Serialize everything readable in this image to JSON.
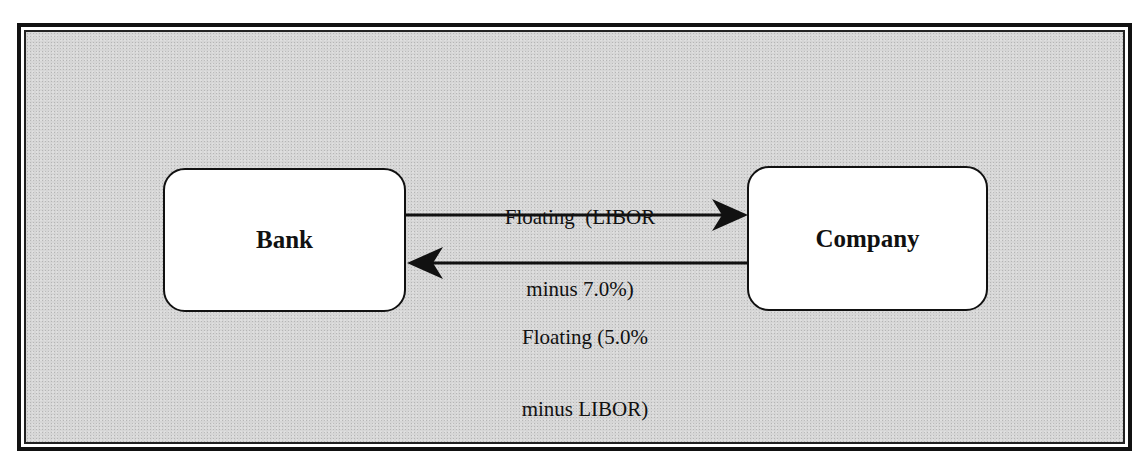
{
  "diagram": {
    "type": "swap-flow",
    "nodes": [
      {
        "id": "bank",
        "label": "Bank"
      },
      {
        "id": "company",
        "label": "Company"
      }
    ],
    "edges": [
      {
        "from": "bank",
        "to": "company",
        "label_line1": "Floating  (LIBOR",
        "label_line2": "minus 7.0%)"
      },
      {
        "from": "company",
        "to": "bank",
        "label_line1": "Floating (5.0%",
        "label_line2": "minus LIBOR)"
      }
    ]
  },
  "colors": {
    "background": "#d6d6d6",
    "node_fill": "#ffffff",
    "stroke": "#111111"
  }
}
